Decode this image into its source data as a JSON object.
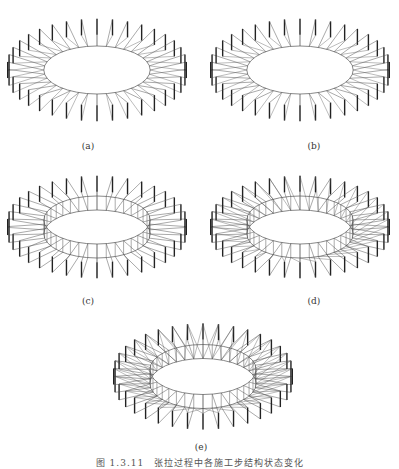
{
  "figure": {
    "panels": [
      {
        "id": "a",
        "label": "(a)",
        "variant": "radial-struts"
      },
      {
        "id": "b",
        "label": "(b)",
        "variant": "radial-struts"
      },
      {
        "id": "c",
        "label": "(c)",
        "variant": "inner-ring"
      },
      {
        "id": "d",
        "label": "(d)",
        "variant": "inner-ring-diagonal"
      },
      {
        "id": "e",
        "label": "(e)",
        "variant": "inner-ring-cross"
      }
    ],
    "caption": "图 1.3.11　张拉过程中各施工步结构状态变化",
    "colors": {
      "line": "#555555",
      "strut": "#222222",
      "background": "#ffffff"
    },
    "strut_count": 36
  }
}
